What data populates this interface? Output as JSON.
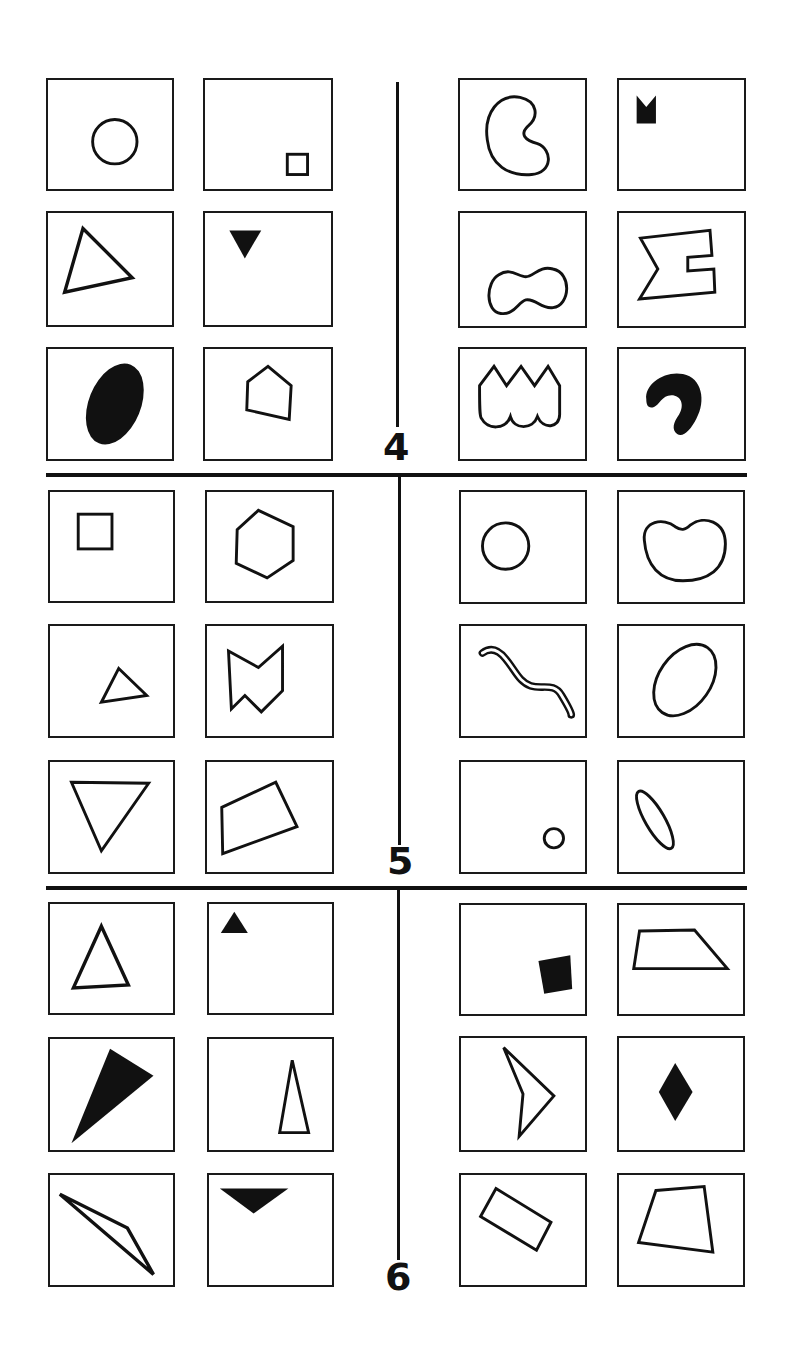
{
  "problems": [
    {
      "label": "4",
      "left_cards": [
        {
          "shape": "circle-outline"
        },
        {
          "shape": "small-square-outline"
        },
        {
          "shape": "triangle-outline"
        },
        {
          "shape": "small-inverted-triangle-filled"
        },
        {
          "shape": "ellipse-filled"
        },
        {
          "shape": "pentagon-outline"
        }
      ],
      "right_cards": [
        {
          "shape": "kidney-c-outline"
        },
        {
          "shape": "notched-square-filled"
        },
        {
          "shape": "peanut-outline"
        },
        {
          "shape": "sigma-polygon-outline"
        },
        {
          "shape": "crown-scallop-outline"
        },
        {
          "shape": "hook-blob-filled"
        }
      ]
    },
    {
      "label": "5",
      "left_cards": [
        {
          "shape": "square-outline"
        },
        {
          "shape": "hexagon-outline"
        },
        {
          "shape": "small-triangle-outline"
        },
        {
          "shape": "zigzag-polygon-outline"
        },
        {
          "shape": "inverted-triangle-outline"
        },
        {
          "shape": "quadrilateral-outline"
        }
      ],
      "right_cards": [
        {
          "shape": "circle-outline"
        },
        {
          "shape": "bean-outline"
        },
        {
          "shape": "worm-outline"
        },
        {
          "shape": "oval-outline"
        },
        {
          "shape": "small-circle-outline"
        },
        {
          "shape": "narrow-ellipse-outline"
        }
      ]
    },
    {
      "label": "6",
      "left_cards": [
        {
          "shape": "triangle-outline"
        },
        {
          "shape": "small-triangle-filled"
        },
        {
          "shape": "wedge-triangle-filled"
        },
        {
          "shape": "tall-thin-triangle-outline"
        },
        {
          "shape": "long-thin-triangle-outline"
        },
        {
          "shape": "inverted-triangle-filled"
        }
      ],
      "right_cards": [
        {
          "shape": "square-filled"
        },
        {
          "shape": "trapezoid-outline"
        },
        {
          "shape": "arrowhead-outline"
        },
        {
          "shape": "diamond-filled"
        },
        {
          "shape": "rectangle-outline"
        },
        {
          "shape": "quadrilateral-outline"
        }
      ]
    }
  ],
  "colors": {
    "ink": "#111111",
    "background": "#ffffff"
  }
}
